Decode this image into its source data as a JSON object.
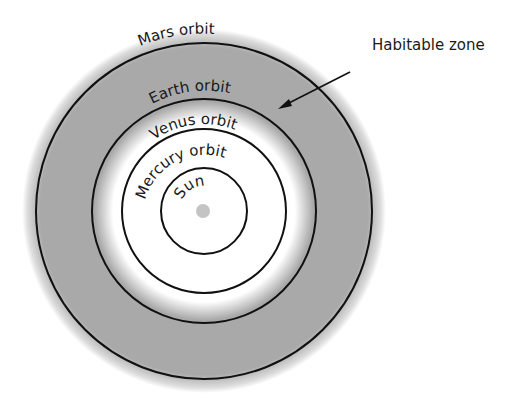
{
  "diagram": {
    "center": {
      "x": 204,
      "y": 211
    },
    "colors": {
      "zone_fill": "#a8a8a8",
      "orbit_stroke": "#111111",
      "sun_fill": "#c4c4c4",
      "background": "#ffffff"
    },
    "orbits": [
      {
        "name": "Mars orbit",
        "radius": 168
      },
      {
        "name": "Earth orbit",
        "radius": 112
      },
      {
        "name": "Venus orbit",
        "radius": 82
      },
      {
        "name": "Mercury orbit",
        "radius": 43
      }
    ],
    "sun": {
      "label": "Sun",
      "radius": 7
    },
    "habitable_zone": {
      "label": "Habitable zone",
      "inner_radius": 98,
      "outer_radius": 178
    }
  }
}
